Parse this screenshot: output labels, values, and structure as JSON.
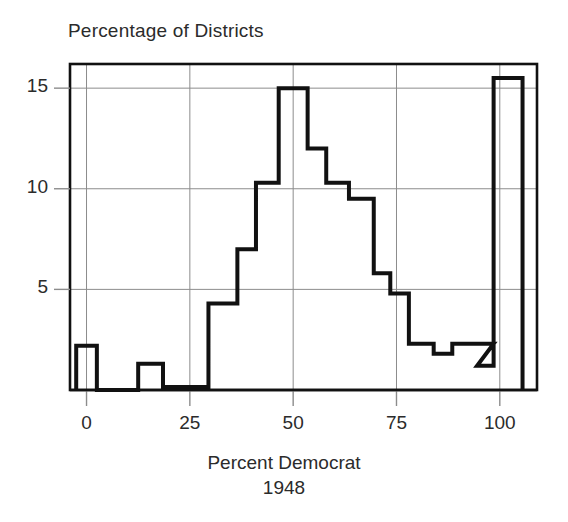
{
  "figure": {
    "width": 568,
    "height": 522,
    "background": "#ffffff",
    "ink_color": "#111111",
    "grid_color": "#8c8c8c"
  },
  "labels": {
    "y_axis_title": "Percentage of Districts",
    "x_axis_title_line1": "Percent Democrat",
    "x_axis_title_line2": "1948"
  },
  "chart_data": {
    "type": "bar",
    "title": "",
    "subtitle": "",
    "xlabel": "Percent Democrat 1948",
    "ylabel": "Percentage of Districts",
    "xlim": [
      -4,
      109
    ],
    "ylim": [
      0,
      16.2
    ],
    "xticks": [
      0,
      25,
      50,
      75,
      100
    ],
    "xtick_labels": [
      "0",
      "25",
      "50",
      "75",
      "100"
    ],
    "yticks": [
      5,
      10,
      15
    ],
    "ytick_labels": [
      "5",
      "10",
      "15"
    ],
    "grid": true,
    "grid_axis": "both",
    "legend": "none",
    "bin_width": 5,
    "note": "Histogram of U.S. congressional districts by percent Democratic vote, 1948. Outline (step) style histogram; spikes at 0% and 100% represent uncontested districts.",
    "bins": [
      {
        "x0": -2.5,
        "x1": 2.5,
        "value": 2.2
      },
      {
        "x0": 2.5,
        "x1": 12.5,
        "value": 0.0
      },
      {
        "x0": 12.5,
        "x1": 18.5,
        "value": 1.3
      },
      {
        "x0": 18.5,
        "x1": 29.5,
        "value": 0.15
      },
      {
        "x0": 29.5,
        "x1": 36.5,
        "value": 4.3
      },
      {
        "x0": 36.5,
        "x1": 41.0,
        "value": 7.0
      },
      {
        "x0": 41.0,
        "x1": 46.5,
        "value": 10.3
      },
      {
        "x0": 46.5,
        "x1": 53.5,
        "value": 15.0
      },
      {
        "x0": 53.5,
        "x1": 58.0,
        "value": 12.0
      },
      {
        "x0": 58.0,
        "x1": 63.5,
        "value": 10.3
      },
      {
        "x0": 63.5,
        "x1": 69.5,
        "value": 9.5
      },
      {
        "x0": 69.5,
        "x1": 73.5,
        "value": 5.8
      },
      {
        "x0": 73.5,
        "x1": 78.0,
        "value": 4.8
      },
      {
        "x0": 78.0,
        "x1": 84.0,
        "value": 2.3
      },
      {
        "x0": 84.0,
        "x1": 88.5,
        "value": 1.8
      },
      {
        "x0": 88.5,
        "x1": 98.5,
        "value": 2.3
      },
      {
        "x0": 94.5,
        "x1": 98.5,
        "value": 1.2
      },
      {
        "x0": 98.5,
        "x1": 105.5,
        "value": 15.5
      }
    ],
    "categories": [
      "0",
      "15",
      "25",
      "33",
      "39",
      "44",
      "50",
      "56",
      "61",
      "66",
      "71",
      "76",
      "81",
      "86",
      "91",
      "96",
      "102"
    ],
    "values": [
      2.2,
      1.3,
      0.15,
      4.3,
      7.0,
      10.3,
      15.0,
      12.0,
      10.3,
      9.5,
      5.8,
      4.8,
      2.3,
      1.8,
      2.3,
      1.2,
      15.5
    ]
  }
}
